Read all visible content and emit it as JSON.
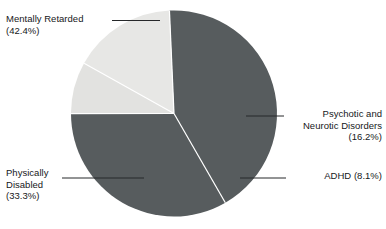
{
  "chart_data": {
    "type": "pie",
    "title": "",
    "subtitle": "",
    "xlabel": "",
    "ylabel": "",
    "legend_position": "callout-labels",
    "grid": false,
    "categories": [
      "Mentally Retarded",
      "Physically Disabled",
      "Psychotic and Neurotic Disorders",
      "ADHD"
    ],
    "values": [
      42.4,
      33.3,
      16.2,
      8.1
    ],
    "units": "%",
    "slices": [
      {
        "label": "Mentally Retarded",
        "value": 42.4,
        "value_text": "(42.4%)",
        "color": "#575c5e",
        "start_angle_deg": 180,
        "end_angle_deg": 332.6
      },
      {
        "label": "Physically Disabled",
        "value": 33.3,
        "value_text": "(33.3%)",
        "color": "#575c5e",
        "start_angle_deg": 60.1,
        "end_angle_deg": 180
      },
      {
        "label": "Psychotic and Neurotic Disorders",
        "value": 16.2,
        "value_text": "(16.2%)",
        "color": "#e7e7e5",
        "start_angle_deg": 332.6,
        "end_angle_deg": 29.2
      },
      {
        "label": "ADHD",
        "value": 8.1,
        "value_text": "(8.1%)",
        "color": "#e2e2e0",
        "start_angle_deg": 29.2,
        "end_angle_deg": 60.1
      }
    ]
  },
  "labels": {
    "mentally_retarded": "Mentally Retarded\n(42.4%)",
    "physically_disabled": "Physically\nDisabled\n(33.3%)",
    "psychotic": "Psychotic and\nNeurotic Disorders\n(16.2%)",
    "adhd": "ADHD (8.1%)"
  },
  "colors": {
    "background": "#ffffff",
    "slice_dark": "#575c5e",
    "slice_light": "#e7e7e5",
    "slice_light_alt": "#e2e2e0",
    "text": "#16181a",
    "leader_line": "#26282a",
    "slice_divider": "#ffffff"
  }
}
